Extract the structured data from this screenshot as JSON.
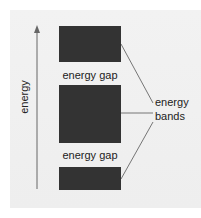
{
  "diagram": {
    "axis": {
      "label": "energy",
      "direction": "up"
    },
    "bands": [
      {
        "name": "upper band",
        "top": 26,
        "height": 36
      },
      {
        "name": "middle band",
        "top": 85,
        "height": 58
      },
      {
        "name": "lower band",
        "top": 167,
        "height": 23
      }
    ],
    "gaps": [
      {
        "label": "energy gap",
        "top": 69
      },
      {
        "label": "energy gap",
        "top": 149
      }
    ],
    "callout": {
      "line1": "energy",
      "line2": "bands"
    },
    "colors": {
      "band": "#333333",
      "background": "#efefef",
      "line": "#555555"
    }
  }
}
